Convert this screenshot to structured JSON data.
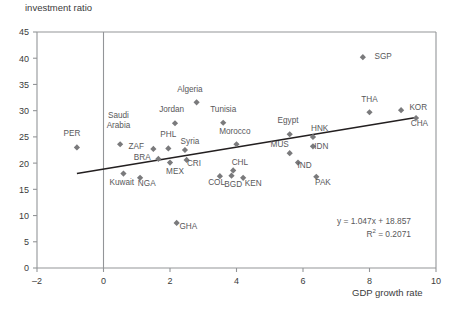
{
  "chart_data": {
    "type": "scatter",
    "title": "",
    "ylabel": "investment ratio",
    "xlabel": "GDP growth rate",
    "xlim": [
      -2,
      10
    ],
    "ylim": [
      0,
      45
    ],
    "xticks": [
      -2,
      0,
      2,
      4,
      6,
      8,
      10
    ],
    "yticks": [
      0,
      5,
      10,
      15,
      20,
      25,
      30,
      35,
      40,
      45
    ],
    "xtick_labels": [
      "–2",
      "0",
      "2",
      "4",
      "6",
      "8",
      "10"
    ],
    "ytick_labels": [
      "0",
      "5",
      "10",
      "15",
      "20",
      "25",
      "30",
      "35",
      "40",
      "45"
    ],
    "grid": false,
    "legend": "none",
    "marker_color": "#7a7a7c",
    "line_color": "#231f20",
    "axis_color": "#939598",
    "trendline": {
      "slope": 1.047,
      "intercept": 18.857,
      "r2": 0.2071,
      "equation_text": "y = 1.047x + 18.857",
      "r2_label": "R",
      "r2_exponent": "2",
      "r2_value": "= 0.2071",
      "x_start": -0.8,
      "x_end": 9.4
    },
    "points": [
      {
        "label": "PER",
        "x": -0.8,
        "y": 23.0,
        "lx": -0.95,
        "ly": 25.2,
        "anchor": "middle"
      },
      {
        "label": "Saudi Arabia",
        "x": 0.5,
        "y": 23.6,
        "lx": 0.45,
        "ly": 28.6,
        "anchor": "middle",
        "line2": "Arabia",
        "two_line": true
      },
      {
        "label": "Kuwait",
        "x": 0.6,
        "y": 18.0,
        "lx": 0.55,
        "ly": 15.8,
        "anchor": "middle"
      },
      {
        "label": "NGA",
        "x": 1.1,
        "y": 17.2,
        "lx": 1.3,
        "ly": 15.6,
        "anchor": "middle"
      },
      {
        "label": "ZAF",
        "x": 1.5,
        "y": 22.7,
        "lx": 1.22,
        "ly": 22.6,
        "anchor": "end"
      },
      {
        "label": "BRA",
        "x": 1.65,
        "y": 20.8,
        "lx": 1.42,
        "ly": 20.6,
        "anchor": "end"
      },
      {
        "label": "PHL",
        "x": 1.95,
        "y": 22.8,
        "lx": 1.95,
        "ly": 24.9,
        "anchor": "middle"
      },
      {
        "label": "MEX",
        "x": 2.0,
        "y": 20.1,
        "lx": 2.15,
        "ly": 18.0,
        "anchor": "middle"
      },
      {
        "label": "Jordan",
        "x": 2.15,
        "y": 27.6,
        "lx": 2.05,
        "ly": 29.7,
        "anchor": "middle"
      },
      {
        "label": "GHA",
        "x": 2.2,
        "y": 8.6,
        "lx": 2.55,
        "ly": 7.4,
        "anchor": "middle"
      },
      {
        "label": "Syria",
        "x": 2.45,
        "y": 22.5,
        "lx": 2.6,
        "ly": 23.6,
        "anchor": "middle"
      },
      {
        "label": "CRI",
        "x": 2.5,
        "y": 20.6,
        "lx": 2.72,
        "ly": 19.5,
        "anchor": "middle"
      },
      {
        "label": "Algeria",
        "x": 2.8,
        "y": 31.6,
        "lx": 2.6,
        "ly": 33.5,
        "anchor": "middle"
      },
      {
        "label": "COL",
        "x": 3.5,
        "y": 17.5,
        "lx": 3.4,
        "ly": 15.9,
        "anchor": "middle"
      },
      {
        "label": "Tunisia",
        "x": 3.6,
        "y": 27.7,
        "lx": 3.6,
        "ly": 29.8,
        "anchor": "middle"
      },
      {
        "label": "BGD",
        "x": 3.85,
        "y": 17.6,
        "lx": 3.9,
        "ly": 15.4,
        "anchor": "middle"
      },
      {
        "label": "CHL",
        "x": 3.9,
        "y": 18.6,
        "lx": 4.1,
        "ly": 19.6,
        "anchor": "middle"
      },
      {
        "label": "Morocco",
        "x": 4.0,
        "y": 23.6,
        "lx": 3.95,
        "ly": 25.5,
        "anchor": "middle"
      },
      {
        "label": "KEN",
        "x": 4.2,
        "y": 17.2,
        "lx": 4.5,
        "ly": 15.6,
        "anchor": "middle"
      },
      {
        "label": "MUS",
        "x": 5.6,
        "y": 21.9,
        "lx": 5.3,
        "ly": 23.0,
        "anchor": "middle"
      },
      {
        "label": "Egypt",
        "x": 5.6,
        "y": 25.5,
        "lx": 5.55,
        "ly": 27.7,
        "anchor": "middle"
      },
      {
        "label": "IND",
        "x": 5.85,
        "y": 20.1,
        "lx": 6.05,
        "ly": 19.1,
        "anchor": "middle"
      },
      {
        "label": "HNK",
        "x": 6.3,
        "y": 25.0,
        "lx": 6.5,
        "ly": 26.1,
        "anchor": "middle"
      },
      {
        "label": "IDN",
        "x": 6.3,
        "y": 23.2,
        "lx": 6.55,
        "ly": 22.7,
        "anchor": "middle"
      },
      {
        "label": "PAK",
        "x": 6.4,
        "y": 17.4,
        "lx": 6.6,
        "ly": 15.8,
        "anchor": "middle"
      },
      {
        "label": "SGP",
        "x": 7.8,
        "y": 40.2,
        "lx": 8.15,
        "ly": 39.9,
        "anchor": "start"
      },
      {
        "label": "THA",
        "x": 8.0,
        "y": 29.7,
        "lx": 8.0,
        "ly": 31.6,
        "anchor": "middle"
      },
      {
        "label": "KOR",
        "x": 8.95,
        "y": 30.1,
        "lx": 9.2,
        "ly": 30.1,
        "anchor": "start"
      },
      {
        "label": "CHA",
        "x": 9.4,
        "y": 28.6,
        "lx": 9.5,
        "ly": 27.0,
        "anchor": "middle"
      }
    ]
  },
  "caption": ""
}
